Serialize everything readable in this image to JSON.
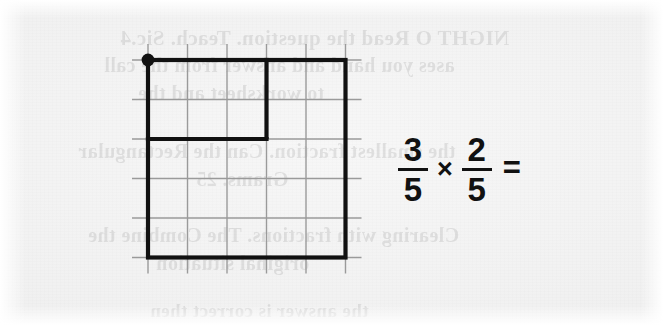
{
  "page": {
    "width": 663,
    "height": 325,
    "background_color": "#f1f1f1",
    "paper_type": "scanned-worksheet"
  },
  "diagram": {
    "name": "fraction-area-model",
    "grid": {
      "columns": 5,
      "rows": 5,
      "cell_size": 39.5,
      "origin_x": 148,
      "origin_y": 60,
      "faint_line_color": "#9a9a9a",
      "faint_line_width": 1.4,
      "overhang": 16
    },
    "bold_outline": {
      "color": "#111111",
      "line_width": 4.2,
      "outer_square": {
        "x": 148,
        "y": 60,
        "width": 197.5,
        "height": 197.5
      },
      "inner_step": {
        "columns": 3,
        "rows": 2,
        "x": 148,
        "y": 60,
        "width": 118.5,
        "height": 79
      }
    },
    "marker_dot": {
      "name": "corner-dot",
      "cx": 148,
      "cy": 60,
      "r": 6.4,
      "color": "#111111"
    }
  },
  "expression": {
    "name": "fraction-multiplication",
    "first_fraction": {
      "numerator": "3",
      "denominator": "5"
    },
    "operator": "×",
    "second_fraction": {
      "numerator": "2",
      "denominator": "5"
    },
    "equals": "=",
    "text": "3/5 × 2/5 =",
    "color": "#111111"
  },
  "bleed_text": {
    "note": "faint mirrored show-through text from the reverse side of the page",
    "lines": [
      {
        "text": "NIGHT O Read the question. Teach. Sic.4",
        "x": 120,
        "y": 26,
        "size": 21
      },
      {
        "text": "ases you hand and answer from the call",
        "x": 104,
        "y": 54,
        "size": 20
      },
      {
        "text": "to worksheet and the",
        "x": 138,
        "y": 82,
        "size": 20
      },
      {
        "text": "the smallest fraction. Can the Rectangular",
        "x": 78,
        "y": 140,
        "size": 20
      },
      {
        "text": "Grams.   25",
        "x": 196,
        "y": 168,
        "size": 20
      },
      {
        "text": "Clearing with fractions. The Combine the",
        "x": 88,
        "y": 224,
        "size": 20
      },
      {
        "text": "original situation",
        "x": 156,
        "y": 252,
        "size": 20
      },
      {
        "text": "the answer is correct then",
        "x": 150,
        "y": 300,
        "size": 19
      }
    ]
  }
}
